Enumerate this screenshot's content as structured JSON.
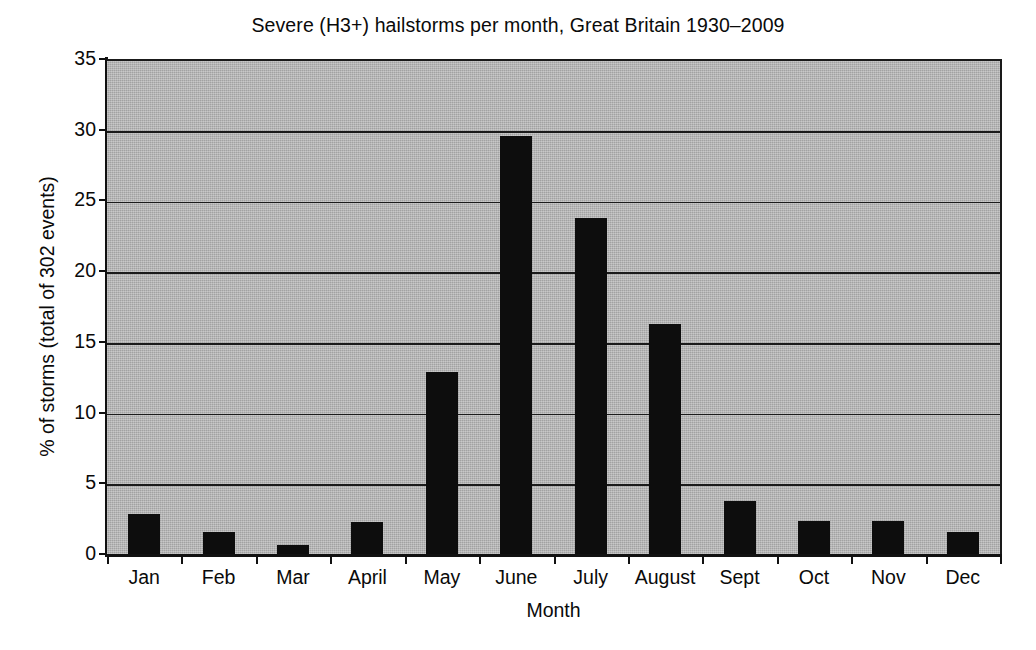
{
  "chart_data": {
    "type": "bar",
    "title": "Severe (H3+) hailstorms per month, Great Britain 1930–2009",
    "xlabel": "Month",
    "ylabel": "% of storms (total of 302 events)",
    "categories": [
      "Jan",
      "Feb",
      "Mar",
      "April",
      "May",
      "June",
      "July",
      "August",
      "Sept",
      "Oct",
      "Nov",
      "Dec"
    ],
    "values": [
      3.0,
      1.7,
      0.8,
      2.4,
      13.0,
      29.7,
      23.9,
      16.4,
      3.9,
      2.5,
      2.5,
      1.7
    ],
    "ylim": [
      0,
      35
    ],
    "ytick_labels": [
      "0",
      "5",
      "10",
      "15",
      "20",
      "25",
      "30",
      "35"
    ],
    "ytick_values": [
      0,
      5,
      10,
      15,
      20,
      25,
      30,
      35
    ],
    "grid": "horizontal",
    "legend": "none",
    "bar_color": "#0d0d0d",
    "plot_background_color": "#b4b4b4",
    "gridline_color": "#1b1b1b",
    "axis_color": "#111111",
    "figure_background_color": "#ffffff"
  }
}
